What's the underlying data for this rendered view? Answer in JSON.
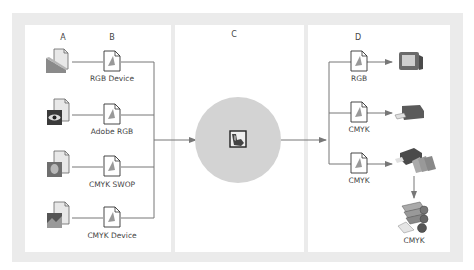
{
  "columns": {
    "a": {
      "header": "A"
    },
    "b": {
      "header": "B"
    },
    "c": {
      "header": "C"
    },
    "d": {
      "header": "D"
    }
  },
  "sources": [
    {
      "icon": "scanner-document-icon",
      "profile_label": "RGB Device"
    },
    {
      "icon": "eye-image-document-icon",
      "profile_label": "Adobe RGB"
    },
    {
      "icon": "portrait-image-document-icon",
      "profile_label": "CMYK SWOP"
    },
    {
      "icon": "landscape-image-document-icon",
      "profile_label": "CMYK Device"
    }
  ],
  "center": {
    "icon": "color-management-engine-icon"
  },
  "outputs": [
    {
      "profile_label": "RGB",
      "device": "monitor-icon"
    },
    {
      "profile_label": "CMYK",
      "device": "desktop-printer-icon"
    },
    {
      "profile_label": "CMYK",
      "device": "proof-printer-icon"
    }
  ],
  "press": {
    "label": "CMYK",
    "icon": "printing-press-icon"
  },
  "colors": {
    "frame": "#ebebeb",
    "line": "#777777",
    "circle": "#d3d3d3",
    "device_dark": "#5a5a5a"
  }
}
